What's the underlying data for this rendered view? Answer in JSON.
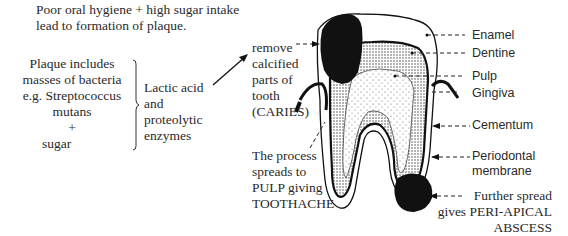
{
  "intro": {
    "line1": "Poor oral hygiene + high sugar intake",
    "line2": "lead to formation of plaque."
  },
  "plaque": {
    "lines": [
      "Plaque includes",
      "masses of bacteria",
      "e.g. Streptococcus",
      "mutans",
      "+",
      "sugar"
    ]
  },
  "products": {
    "lines": [
      "Lactic acid",
      "and",
      "proteolytic",
      "enzymes"
    ]
  },
  "caries": {
    "lines": [
      "remove",
      "calcified",
      "parts of",
      "tooth",
      "(CARIES)"
    ]
  },
  "pulp_spread": {
    "lines": [
      "The process",
      "spreads to",
      "PULP giving",
      "TOOTHACHE"
    ]
  },
  "labels": {
    "enamel": "Enamel",
    "dentine": "Dentine",
    "pulp": "Pulp",
    "gingiva": "Gingiva",
    "cementum": "Cementum",
    "periodontal_1": "Periodontal",
    "periodontal_2": "membrane"
  },
  "abscess": {
    "lines": [
      "Further spread",
      "gives PERI-APICAL",
      "ABSCESS"
    ]
  },
  "colors": {
    "ink": "#111111",
    "text": "#2a2a2a",
    "stipple": "#bdbdbd"
  }
}
